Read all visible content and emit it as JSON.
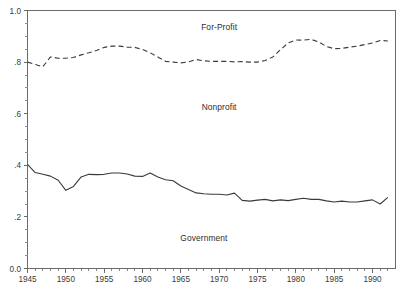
{
  "chart_data": {
    "type": "line",
    "title": "",
    "subtitle": "",
    "xlabel": "",
    "ylabel": "",
    "xlim": [
      1945,
      1993
    ],
    "ylim": [
      0.0,
      1.0
    ],
    "grid": false,
    "legend_position": "inline-annotations",
    "x_tick_labels": [
      "1945",
      "1950",
      "1955",
      "1960",
      "1965",
      "1970",
      "1975",
      "1980",
      "1985",
      "1990"
    ],
    "x_ticks": [
      1945,
      1950,
      1955,
      1960,
      1965,
      1970,
      1975,
      1980,
      1985,
      1990
    ],
    "x_minor_ticks": [
      1946,
      1947,
      1948,
      1949,
      1951,
      1952,
      1953,
      1954,
      1956,
      1957,
      1958,
      1959,
      1961,
      1962,
      1963,
      1964,
      1966,
      1967,
      1968,
      1969,
      1971,
      1972,
      1973,
      1974,
      1976,
      1977,
      1978,
      1979,
      1981,
      1982,
      1983,
      1984,
      1986,
      1987,
      1988,
      1989,
      1991,
      1992
    ],
    "y_tick_labels": [
      "1.0",
      ".8",
      ".6",
      ".4",
      ".2",
      "0.0"
    ],
    "y_ticks": [
      1.0,
      0.8,
      0.6,
      0.4,
      0.2,
      0.0
    ],
    "y_minor_ticks": [
      0.95,
      0.9,
      0.85,
      0.75,
      0.7,
      0.65,
      0.55,
      0.5,
      0.45,
      0.35,
      0.3,
      0.25,
      0.15,
      0.1,
      0.05
    ],
    "x": [
      1945,
      1946,
      1947,
      1948,
      1949,
      1950,
      1951,
      1952,
      1953,
      1954,
      1955,
      1956,
      1957,
      1958,
      1959,
      1960,
      1961,
      1962,
      1963,
      1964,
      1965,
      1966,
      1967,
      1968,
      1969,
      1970,
      1971,
      1972,
      1973,
      1974,
      1975,
      1976,
      1977,
      1978,
      1979,
      1980,
      1981,
      1982,
      1983,
      1984,
      1985,
      1986,
      1987,
      1988,
      1989,
      1990,
      1991,
      1992
    ],
    "series": [
      {
        "name": "For-Profit",
        "label": "For-Profit",
        "style": "dashed",
        "color": "#3a3a3a",
        "description": "Upper cumulative boundary: share at or below the for-profit band top",
        "values": [
          0.8,
          0.791,
          0.782,
          0.82,
          0.815,
          0.815,
          0.818,
          0.828,
          0.836,
          0.845,
          0.857,
          0.862,
          0.862,
          0.858,
          0.857,
          0.849,
          0.836,
          0.82,
          0.803,
          0.8,
          0.797,
          0.801,
          0.81,
          0.805,
          0.803,
          0.803,
          0.803,
          0.801,
          0.802,
          0.8,
          0.8,
          0.806,
          0.82,
          0.848,
          0.874,
          0.886,
          0.885,
          0.888,
          0.878,
          0.86,
          0.852,
          0.853,
          0.858,
          0.862,
          0.868,
          0.874,
          0.884,
          0.882
        ]
      },
      {
        "name": "Government",
        "label": "Government",
        "style": "solid",
        "color": "#3a3a3a",
        "description": "Lower cumulative boundary: government share of hospitals",
        "values": [
          0.404,
          0.372,
          0.365,
          0.358,
          0.342,
          0.303,
          0.318,
          0.355,
          0.365,
          0.364,
          0.365,
          0.37,
          0.37,
          0.366,
          0.358,
          0.357,
          0.37,
          0.355,
          0.344,
          0.34,
          0.32,
          0.306,
          0.293,
          0.29,
          0.288,
          0.288,
          0.285,
          0.292,
          0.264,
          0.261,
          0.265,
          0.268,
          0.262,
          0.266,
          0.263,
          0.268,
          0.272,
          0.268,
          0.268,
          0.262,
          0.258,
          0.261,
          0.258,
          0.258,
          0.262,
          0.266,
          0.25,
          0.276
        ]
      }
    ],
    "band_annotations": [
      {
        "key": "for_profit",
        "label": "For-Profit",
        "x": 1970,
        "y": 0.935
      },
      {
        "key": "nonprofit",
        "label": "Nonprofit",
        "x": 1970,
        "y": 0.625
      },
      {
        "key": "government",
        "label": "Government",
        "x": 1968,
        "y": 0.118
      }
    ]
  },
  "axes": {
    "y_title": "",
    "x_title": ""
  }
}
